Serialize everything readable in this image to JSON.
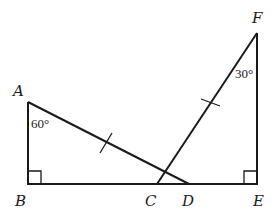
{
  "diagram": {
    "type": "geometry",
    "points": {
      "A": {
        "label": "A",
        "x": 28,
        "y": 102
      },
      "B": {
        "label": "B",
        "x": 28,
        "y": 184
      },
      "C": {
        "label": "C",
        "x": 157,
        "y": 184
      },
      "D": {
        "label": "D",
        "x": 189,
        "y": 184
      },
      "E": {
        "label": "E",
        "x": 257,
        "y": 184
      },
      "F": {
        "label": "F",
        "x": 257,
        "y": 33
      }
    },
    "segments": [
      {
        "from": "A",
        "to": "B"
      },
      {
        "from": "B",
        "to": "E"
      },
      {
        "from": "A",
        "to": "D"
      },
      {
        "from": "C",
        "to": "F"
      },
      {
        "from": "F",
        "to": "E"
      }
    ],
    "right_angles": [
      "B",
      "E"
    ],
    "angles": [
      {
        "vertex": "A",
        "text": "60°"
      },
      {
        "vertex": "F",
        "text": "30°"
      }
    ],
    "equal_marks": [
      {
        "segment": "AD",
        "ticks": 1
      },
      {
        "segment": "CF",
        "ticks": 1
      }
    ],
    "colors": {
      "stroke": "#1a1a1a",
      "background": "#ffffff"
    }
  }
}
